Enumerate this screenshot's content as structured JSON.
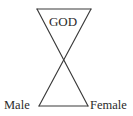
{
  "diagram": {
    "background_color": "#ffffff",
    "stroke_color": "#3a3a3a",
    "text_color": "#2b2b2b",
    "labels": {
      "god": "GOD",
      "male": "Male",
      "female": "Female"
    },
    "geometry": {
      "top_left_vertex": "37,9",
      "top_right_vertex": "91,9",
      "bottom_left_vertex": "39,106",
      "bottom_right_vertex": "88,106",
      "crossing_point": "63,57",
      "top_edge": "37,9 91,9",
      "bottom_edge": "39,106 88,106",
      "diagonal_left_to_right": "37,9 88,106",
      "diagonal_right_to_left": "91,9 39,106"
    },
    "label_positions": {
      "god_x": "63",
      "god_y": "26",
      "male_x": "4",
      "male_y": "109",
      "female_x": "90",
      "female_y": "109"
    }
  }
}
